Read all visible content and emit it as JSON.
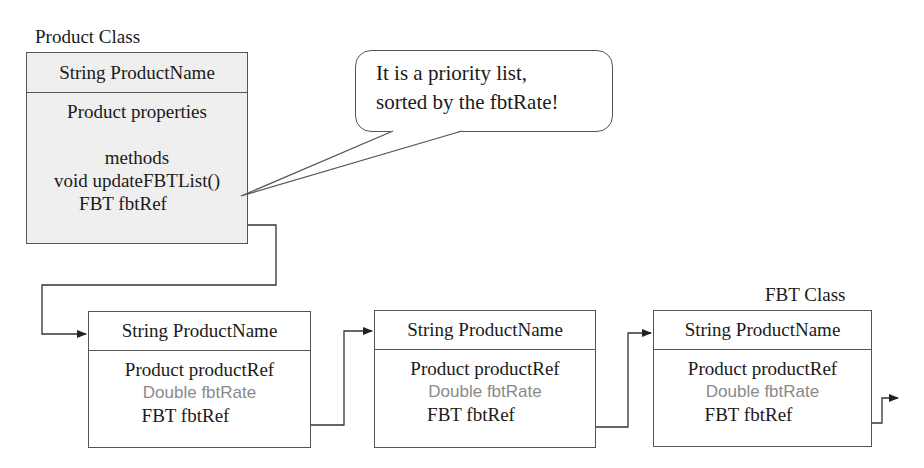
{
  "product_class": {
    "title": "Product  Class",
    "header": "String ProductName",
    "rows": [
      "Product properties",
      "",
      "methods",
      "void updateFBTList()",
      "FBT fbtRef"
    ]
  },
  "callout": {
    "line1": "It is a priority list,",
    "line2": "sorted by the fbtRate!"
  },
  "fbt_class": {
    "title": "FBT Class",
    "nodes": [
      {
        "header": "String ProductName",
        "rows": [
          "Product productRef",
          "Double fbtRate",
          "FBT fbtRef"
        ]
      },
      {
        "header": "String ProductName",
        "rows": [
          "Product productRef",
          "Double fbtRate",
          "FBT fbtRef"
        ]
      },
      {
        "header": "String ProductName",
        "rows": [
          "Product productRef",
          "Double fbtRate",
          "FBT fbtRef"
        ]
      }
    ]
  },
  "colors": {
    "product_fill": "#efefef",
    "line": "#555555",
    "muted_text": "#8a8a8a"
  }
}
